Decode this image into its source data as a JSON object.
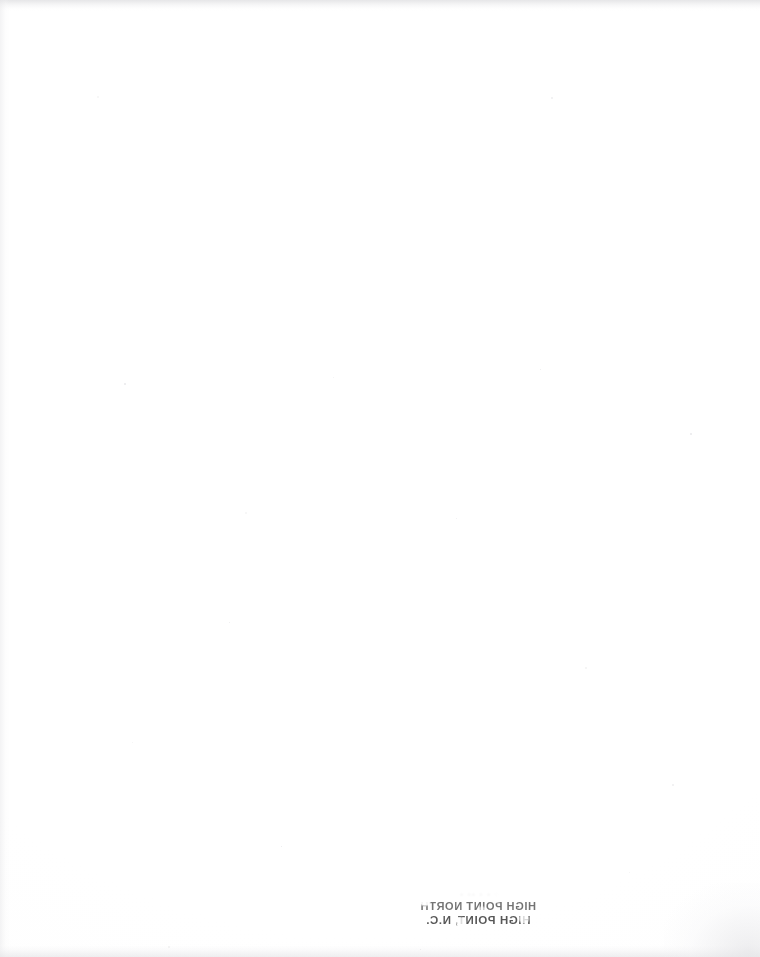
{
  "document": {
    "kind": "scanned-page",
    "appearance": "blank",
    "page_width": 760,
    "page_height": 957,
    "background_color": "#ffffff",
    "paper_tone": "#fdfdfd"
  },
  "body": {
    "content": "",
    "note_visible_text": "none"
  },
  "show_through": {
    "description": "mirrored ink bleeding through from the reverse side of the sheet",
    "position": "lower-centre-right",
    "legible": false,
    "ink_color": "#1d1d1d",
    "lines": [
      {
        "id": "line-1",
        "text": "· · ·  ·· ·",
        "legibility": "illegible"
      },
      {
        "id": "line-2",
        "text": "HIGH POINT NORTH",
        "legibility": "illegible"
      },
      {
        "id": "line-3",
        "text": "HIGH POINT, N.C.",
        "legibility": "illegible"
      }
    ]
  },
  "scan_artifacts": {
    "edge_band_top": "#dedee0",
    "edge_band_bottom": "#e4e4e6",
    "edge_band_left": "#e8e8ea",
    "corner_smudge": "#e2e2e5",
    "speck_color": "#d9d9dc",
    "specks": [
      {
        "x": 97,
        "y": 96,
        "size": 2
      },
      {
        "x": 551,
        "y": 97,
        "size": 2
      },
      {
        "x": 124,
        "y": 383,
        "size": 2
      },
      {
        "x": 333,
        "y": 377,
        "size": 1
      },
      {
        "x": 540,
        "y": 369,
        "size": 1
      },
      {
        "x": 245,
        "y": 512,
        "size": 2
      },
      {
        "x": 456,
        "y": 518,
        "size": 1
      },
      {
        "x": 690,
        "y": 433,
        "size": 2
      },
      {
        "x": 585,
        "y": 667,
        "size": 2
      },
      {
        "x": 229,
        "y": 622,
        "size": 1
      },
      {
        "x": 132,
        "y": 742,
        "size": 1
      },
      {
        "x": 672,
        "y": 784,
        "size": 2
      },
      {
        "x": 281,
        "y": 846,
        "size": 1
      },
      {
        "x": 168,
        "y": 946,
        "size": 2
      },
      {
        "x": 420,
        "y": 949,
        "size": 1
      },
      {
        "x": 629,
        "y": 872,
        "size": 1
      }
    ]
  }
}
